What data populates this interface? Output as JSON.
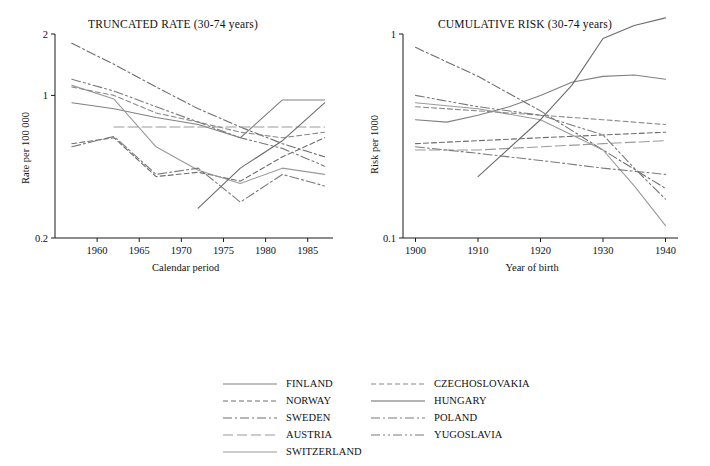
{
  "figure": {
    "width": 710,
    "height": 466,
    "background": "#ffffff"
  },
  "legend": {
    "columns": [
      [
        {
          "name": "FINLAND",
          "style": "solid",
          "color": "#808080"
        },
        {
          "name": "NORWAY",
          "style": "dashed",
          "color": "#6e6e6e"
        },
        {
          "name": "SWEDEN",
          "style": "dashdot",
          "color": "#6e6e6e"
        },
        {
          "name": "AUSTRIA",
          "style": "longdash",
          "color": "#9a9a9a"
        },
        {
          "name": "SWITZERLAND",
          "style": "solid",
          "color": "#9a9a9a"
        }
      ],
      [
        {
          "name": "CZECHOSLOVAKIA",
          "style": "dashed",
          "color": "#8a8a8a"
        },
        {
          "name": "HUNGARY",
          "style": "solid",
          "color": "#6b6b6b"
        },
        {
          "name": "POLAND",
          "style": "dashdot",
          "color": "#7a7a7a"
        },
        {
          "name": "YUGOSLAVIA",
          "style": "dashdotdot",
          "color": "#7a7a7a"
        }
      ]
    ]
  },
  "chart_data": [
    {
      "type": "line",
      "id": "truncated-rate",
      "title": "TRUNCATED RATE (30-74 years)",
      "xlabel": "Calendar period",
      "ylabel": "Rate per 100 000",
      "yscale": "log",
      "ylim": [
        0.2,
        2
      ],
      "yticks": [
        0.2,
        1,
        2
      ],
      "ytick_labels": [
        "0.2",
        "1",
        "2"
      ],
      "xlim": [
        1955,
        1988
      ],
      "xticks": [
        1960,
        1965,
        1970,
        1975,
        1980,
        1985
      ],
      "xtick_labels": [
        "1960",
        "1965",
        "1970",
        "1975",
        "1980",
        "1985"
      ],
      "grid": false,
      "legend_position": "below-figure",
      "series": [
        {
          "name": "FINLAND",
          "style": "solid",
          "color": "#808080",
          "x": [
            1957,
            1962,
            1967,
            1972,
            1977,
            1982,
            1987
          ],
          "y": [
            0.92,
            0.86,
            0.78,
            0.72,
            0.62,
            0.95,
            0.95
          ]
        },
        {
          "name": "NORWAY",
          "style": "dashed",
          "color": "#6e6e6e",
          "x": [
            1957,
            1962,
            1967,
            1972,
            1977,
            1982,
            1987
          ],
          "y": [
            0.58,
            0.62,
            0.4,
            0.42,
            0.38,
            0.5,
            0.62
          ]
        },
        {
          "name": "SWEDEN",
          "style": "dashdot",
          "color": "#6e6e6e",
          "x": [
            1957,
            1962,
            1967,
            1972,
            1977,
            1982,
            1987
          ],
          "y": [
            1.8,
            1.42,
            1.1,
            0.86,
            0.7,
            0.58,
            0.5
          ]
        },
        {
          "name": "AUSTRIA",
          "style": "longdash",
          "color": "#9a9a9a",
          "x": [
            1962,
            1967,
            1972,
            1977,
            1982,
            1987
          ],
          "y": [
            0.7,
            0.7,
            0.7,
            0.7,
            0.7,
            0.7
          ]
        },
        {
          "name": "SWITZERLAND",
          "style": "solid",
          "color": "#9a9a9a",
          "x": [
            1957,
            1962,
            1967,
            1972,
            1977,
            1982,
            1987
          ],
          "y": [
            1.12,
            0.96,
            0.56,
            0.43,
            0.37,
            0.44,
            0.41
          ]
        },
        {
          "name": "CZECHOSLOVAKIA",
          "style": "dashed",
          "color": "#8a8a8a",
          "x": [
            1957,
            1962,
            1967,
            1972,
            1977,
            1982,
            1987
          ],
          "y": [
            1.1,
            1.0,
            0.82,
            0.74,
            0.66,
            0.62,
            0.66
          ]
        },
        {
          "name": "HUNGARY",
          "style": "solid",
          "color": "#6b6b6b",
          "x": [
            1972,
            1977,
            1982,
            1987
          ],
          "y": [
            0.28,
            0.44,
            0.6,
            0.92
          ]
        },
        {
          "name": "POLAND",
          "style": "dashdot",
          "color": "#7a7a7a",
          "x": [
            1957,
            1962,
            1967,
            1972,
            1977,
            1982,
            1987
          ],
          "y": [
            0.56,
            0.63,
            0.41,
            0.44,
            0.3,
            0.41,
            0.36
          ]
        },
        {
          "name": "YUGOSLAVIA",
          "style": "dashdotdot",
          "color": "#7a7a7a",
          "x": [
            1957,
            1962,
            1967,
            1972,
            1977,
            1982,
            1987
          ],
          "y": [
            1.2,
            1.05,
            0.88,
            0.74,
            0.62,
            0.55,
            0.45
          ]
        }
      ]
    },
    {
      "type": "line",
      "id": "cumulative-risk",
      "title": "CUMULATIVE RISK (30-74 years)",
      "xlabel": "Year of birth",
      "ylabel": "Risk per 1000",
      "yscale": "log",
      "ylim": [
        0.1,
        1
      ],
      "yticks": [
        0.1,
        1
      ],
      "ytick_labels": [
        "0.1",
        "1"
      ],
      "xlim": [
        1898,
        1942
      ],
      "xticks": [
        1900,
        1910,
        1920,
        1930,
        1940
      ],
      "xtick_labels": [
        "1900",
        "1910",
        "1920",
        "1930",
        "1940"
      ],
      "grid": false,
      "legend_position": "below-figure",
      "series": [
        {
          "name": "FINLAND",
          "style": "solid",
          "color": "#808080",
          "x": [
            1900,
            1905,
            1910,
            1915,
            1920,
            1925,
            1930,
            1935,
            1940
          ],
          "y": [
            0.38,
            0.37,
            0.4,
            0.44,
            0.5,
            0.58,
            0.62,
            0.63,
            0.6
          ]
        },
        {
          "name": "NORWAY",
          "style": "dashed",
          "color": "#6e6e6e",
          "x": [
            1900,
            1910,
            1920,
            1930,
            1940
          ],
          "y": [
            0.29,
            0.3,
            0.31,
            0.32,
            0.33
          ]
        },
        {
          "name": "SWEDEN",
          "style": "dashdot",
          "color": "#6e6e6e",
          "x": [
            1900,
            1910,
            1920,
            1930,
            1940
          ],
          "y": [
            0.86,
            0.62,
            0.42,
            0.27,
            0.175
          ]
        },
        {
          "name": "AUSTRIA",
          "style": "longdash",
          "color": "#9a9a9a",
          "x": [
            1900,
            1910,
            1920,
            1930,
            1940
          ],
          "y": [
            0.27,
            0.27,
            0.28,
            0.29,
            0.3
          ]
        },
        {
          "name": "SWITZERLAND",
          "style": "solid",
          "color": "#9a9a9a",
          "x": [
            1900,
            1910,
            1920,
            1930,
            1935,
            1940
          ],
          "y": [
            0.46,
            0.43,
            0.38,
            0.27,
            0.18,
            0.115
          ]
        },
        {
          "name": "CZECHOSLOVAKIA",
          "style": "dashed",
          "color": "#8a8a8a",
          "x": [
            1900,
            1910,
            1920,
            1930,
            1940
          ],
          "y": [
            0.44,
            0.42,
            0.4,
            0.38,
            0.36
          ]
        },
        {
          "name": "HUNGARY",
          "style": "solid",
          "color": "#6b6b6b",
          "x": [
            1910,
            1920,
            1925,
            1930,
            1935,
            1940
          ],
          "y": [
            0.2,
            0.38,
            0.56,
            0.95,
            1.1,
            1.2
          ]
        },
        {
          "name": "POLAND",
          "style": "dashdot",
          "color": "#7a7a7a",
          "x": [
            1900,
            1910,
            1920,
            1930,
            1940
          ],
          "y": [
            0.28,
            0.26,
            0.24,
            0.22,
            0.205
          ]
        },
        {
          "name": "YUGOSLAVIA",
          "style": "dashdotdot",
          "color": "#7a7a7a",
          "x": [
            1900,
            1910,
            1920,
            1930,
            1935,
            1940
          ],
          "y": [
            0.5,
            0.44,
            0.4,
            0.32,
            0.22,
            0.155
          ]
        }
      ]
    }
  ]
}
